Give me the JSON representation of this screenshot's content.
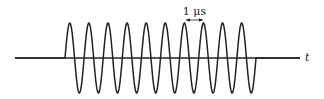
{
  "diagram": {
    "title": "",
    "period_label": "1 μs",
    "axis_label": "t",
    "num_cycles": 10,
    "colors": {
      "line": "#222222",
      "background": "#ffffff"
    }
  }
}
